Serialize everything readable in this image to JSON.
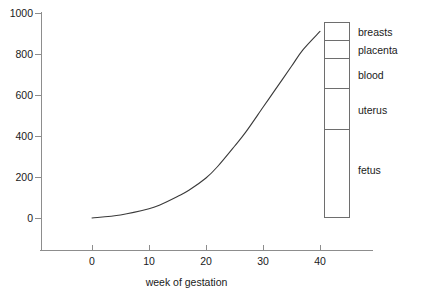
{
  "chart_data": {
    "type": "line",
    "title": "",
    "subtitle": "",
    "xlabel": "week of gestation",
    "ylabel": "",
    "xlim": [
      -3,
      45
    ],
    "ylim": [
      -120,
      1000
    ],
    "grid": false,
    "legend_position": "right-inside",
    "x_ticks": [
      {
        "value": 0,
        "label": "0"
      },
      {
        "value": 10,
        "label": "10"
      },
      {
        "value": 20,
        "label": "20"
      },
      {
        "value": 30,
        "label": "30"
      },
      {
        "value": 40,
        "label": "40"
      }
    ],
    "y_ticks": [
      {
        "value": 0,
        "label": "0"
      },
      {
        "value": 200,
        "label": "200"
      },
      {
        "value": 400,
        "label": "400"
      },
      {
        "value": 600,
        "label": "600"
      },
      {
        "value": 800,
        "label": "800"
      },
      {
        "value": 1000,
        "label": "1000"
      }
    ],
    "series": [
      {
        "name": "total weight gain",
        "x": [
          0,
          5,
          10,
          12,
          15,
          17,
          20,
          22,
          25,
          27,
          30,
          32,
          35,
          37,
          40
        ],
        "values": [
          0,
          15,
          45,
          65,
          105,
          135,
          195,
          250,
          350,
          420,
          540,
          620,
          740,
          820,
          910
        ]
      }
    ],
    "stacked_bar": {
      "name": "composition at 40 weeks",
      "total": 910,
      "segments": [
        {
          "label": "breasts",
          "from": 825,
          "to": 910,
          "value": 85
        },
        {
          "label": "placenta",
          "from": 740,
          "to": 825,
          "value": 85
        },
        {
          "label": "blood",
          "from": 600,
          "to": 740,
          "value": 140
        },
        {
          "label": "uterus",
          "from": 410,
          "to": 600,
          "value": 190
        },
        {
          "label": "fetus",
          "from": 0,
          "to": 410,
          "value": 410
        }
      ]
    },
    "colors": {
      "axis": "#8d8d8d",
      "curve": "#3a3a3a",
      "legend_border": "#6e6e6e",
      "text": "#1a1a1a",
      "background": "#ffffff"
    }
  }
}
